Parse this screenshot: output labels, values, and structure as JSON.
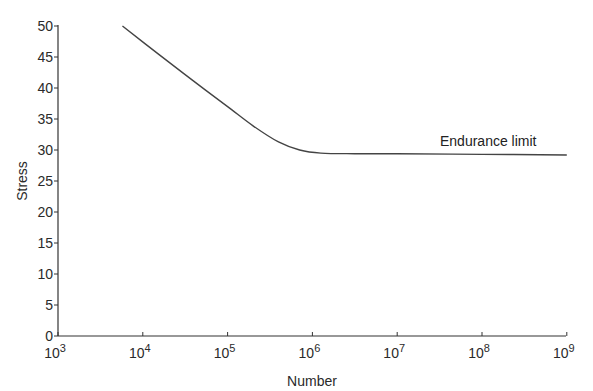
{
  "chart_data": {
    "type": "line",
    "title": "",
    "xlabel": "Number",
    "ylabel": "Stress",
    "xscale": "log",
    "xlim": [
      1000,
      1000000000
    ],
    "ylim": [
      0,
      50
    ],
    "x_ticks": [
      {
        "exp": 3,
        "base": "10",
        "sup": "3"
      },
      {
        "exp": 4,
        "base": "10",
        "sup": "4"
      },
      {
        "exp": 5,
        "base": "10",
        "sup": "5"
      },
      {
        "exp": 6,
        "base": "10",
        "sup": "6"
      },
      {
        "exp": 7,
        "base": "10",
        "sup": "7"
      },
      {
        "exp": 8,
        "base": "10",
        "sup": "8"
      },
      {
        "exp": 9,
        "base": "10",
        "sup": "9"
      }
    ],
    "y_ticks": [
      0,
      5,
      10,
      15,
      20,
      25,
      30,
      35,
      40,
      45,
      50
    ],
    "grid": false,
    "legend": null,
    "series": [
      {
        "name": "S-N curve",
        "points": [
          {
            "log10N": 3.76,
            "stress": 50.0
          },
          {
            "log10N": 4.2,
            "stress": 45.3
          },
          {
            "log10N": 4.6,
            "stress": 41.1
          },
          {
            "log10N": 5.0,
            "stress": 37.0
          },
          {
            "log10N": 5.3,
            "stress": 33.9
          },
          {
            "log10N": 5.6,
            "stress": 31.3
          },
          {
            "log10N": 5.85,
            "stress": 30.0
          },
          {
            "log10N": 6.1,
            "stress": 29.5
          },
          {
            "log10N": 6.5,
            "stress": 29.4
          },
          {
            "log10N": 7.0,
            "stress": 29.4
          },
          {
            "log10N": 8.0,
            "stress": 29.3
          },
          {
            "log10N": 9.0,
            "stress": 29.2
          }
        ]
      }
    ],
    "annotations": [
      {
        "text": "Endurance limit",
        "log10N": 7.5,
        "stress": 31.5
      }
    ]
  }
}
